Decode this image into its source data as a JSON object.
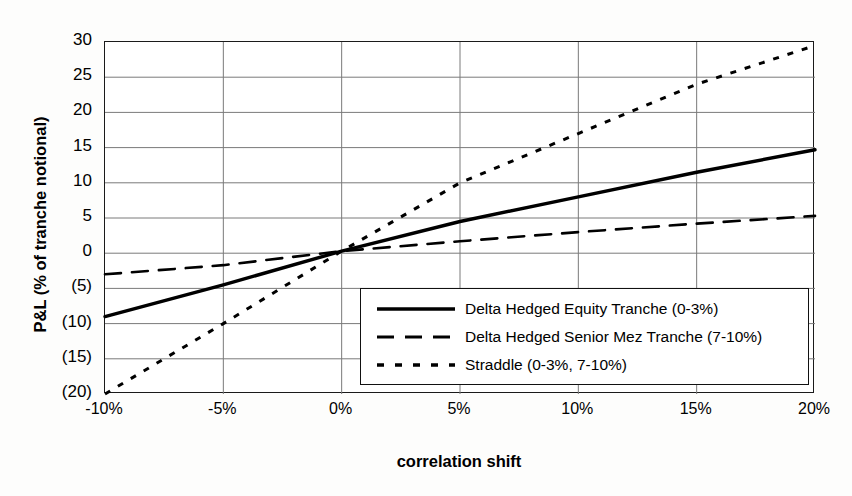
{
  "chart_data": {
    "type": "line",
    "title": "",
    "subtitle": "",
    "xlabel": "correlation shift",
    "ylabel": "P&L (% of tranche notional)",
    "x": [
      -10,
      -5,
      0,
      5,
      10,
      15,
      20
    ],
    "xtick_labels": [
      "-10%",
      "-5%",
      "0%",
      "5%",
      "10%",
      "15%",
      "20%"
    ],
    "ytick_values": [
      30,
      25,
      20,
      15,
      10,
      5,
      0,
      -5,
      -10,
      -15,
      -20
    ],
    "ytick_labels": [
      "30",
      "25",
      "20",
      "15",
      "10",
      "5",
      "0",
      "(5)",
      "(10)",
      "(15)",
      "(20)"
    ],
    "xlim": [
      -10,
      20
    ],
    "ylim": [
      -20,
      30
    ],
    "grid": true,
    "legend_position": "lower-right-inside",
    "series": [
      {
        "name": "Delta Hedged Equity Tranche (0-3%)",
        "style": "solid",
        "color": "#000000",
        "width": 3.4,
        "values": [
          -9.0,
          -4.5,
          0.3,
          4.5,
          8.0,
          11.5,
          14.7
        ]
      },
      {
        "name": "Delta Hedged Senior Mez Tranche (7-10%)",
        "style": "dashed",
        "color": "#000000",
        "width": 2.6,
        "values": [
          -3.0,
          -1.7,
          0.3,
          1.7,
          3.0,
          4.2,
          5.3
        ]
      },
      {
        "name": "Straddle (0-3%, 7-10%)",
        "style": "dotted",
        "color": "#000000",
        "width": 3.0,
        "values": [
          -20.0,
          -10.0,
          0.3,
          10.0,
          17.0,
          24.0,
          29.5
        ]
      }
    ]
  },
  "legend": {
    "entries": [
      {
        "label": "Delta Hedged Equity Tranche (0-3%)",
        "style": "solid"
      },
      {
        "label": "Delta Hedged Senior Mez Tranche (7-10%)",
        "style": "dashed"
      },
      {
        "label": "Straddle (0-3%, 7-10%)",
        "style": "dotted"
      }
    ]
  },
  "axes": {
    "y_title": "P&L (% of tranche notional)",
    "x_title": "correlation shift"
  },
  "colors": {
    "line": "#000000",
    "grid": "#7a7a7a",
    "frame": "#1a1a1a",
    "background": "#ffffff"
  }
}
